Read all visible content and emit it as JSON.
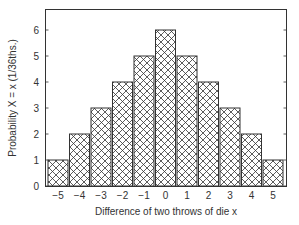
{
  "chart_data": {
    "type": "bar",
    "title": "",
    "xlabel": "Difference of two throws of die x",
    "ylabel": "Probability  X = x (1/36ths.)",
    "categories": [
      "−5",
      "−4",
      "−3",
      "−2",
      "−1",
      "0",
      "1",
      "2",
      "3",
      "4",
      "5"
    ],
    "values": [
      1,
      2,
      3,
      4,
      5,
      6,
      5,
      4,
      3,
      2,
      1
    ],
    "yticks": [
      "0",
      "1",
      "2",
      "3",
      "4",
      "5",
      "6"
    ],
    "ylim": [
      0,
      6.8
    ],
    "grid": false,
    "legend": null,
    "bar_fill": "crosshatch",
    "bar_edge_color": "#333333"
  }
}
